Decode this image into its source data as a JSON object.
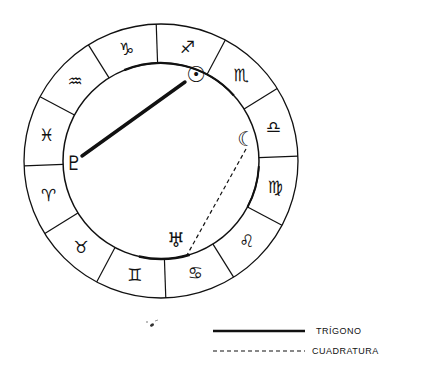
{
  "chart_data": {
    "type": "astrological-wheel",
    "title": "",
    "wheel": {
      "center": [
        161,
        161
      ],
      "outer_radius": 137,
      "inner_radius": 98,
      "rotation_deg": 2,
      "stroke": "#111111"
    },
    "signs": [
      {
        "name": "Sagittarius",
        "glyph": "♐",
        "start_deg": 60
      },
      {
        "name": "Capricorn",
        "glyph": "♑",
        "start_deg": 90
      },
      {
        "name": "Aquarius",
        "glyph": "♒",
        "start_deg": 120
      },
      {
        "name": "Pisces",
        "glyph": "♓",
        "start_deg": 150
      },
      {
        "name": "Aries",
        "glyph": "♈",
        "start_deg": 180
      },
      {
        "name": "Taurus",
        "glyph": "♉",
        "start_deg": 210
      },
      {
        "name": "Gemini",
        "glyph": "♊",
        "start_deg": 240
      },
      {
        "name": "Cancer",
        "glyph": "♋",
        "start_deg": 270
      },
      {
        "name": "Leo",
        "glyph": "♌",
        "start_deg": 300
      },
      {
        "name": "Virgo",
        "glyph": "♍",
        "start_deg": 330
      },
      {
        "name": "Libra",
        "glyph": "♎",
        "start_deg": 0
      },
      {
        "name": "Scorpio",
        "glyph": "♏",
        "start_deg": 30
      }
    ],
    "planets": [
      {
        "name": "Sun",
        "glyph": "☉",
        "x": 196,
        "y": 75
      },
      {
        "name": "Moon",
        "glyph": "☾",
        "x": 246,
        "y": 139
      },
      {
        "name": "Pluto",
        "glyph": "♇",
        "x": 74,
        "y": 163
      },
      {
        "name": "Uranus",
        "glyph": "♅",
        "x": 176,
        "y": 240
      }
    ],
    "aspects": [
      {
        "from": "Pluto",
        "to": "Sun",
        "type": "trigono",
        "style": "solid",
        "x1": 82,
        "y1": 156,
        "x2": 185,
        "y2": 82
      },
      {
        "from": "Moon",
        "to": "Uranus",
        "type": "cuadratura",
        "style": "dashed",
        "x1": 246,
        "y1": 149,
        "x2": 187,
        "y2": 255
      }
    ],
    "legend": [
      {
        "label": "TRÍGONO",
        "style": "solid"
      },
      {
        "label": "CUADRATURA",
        "style": "dashed"
      }
    ]
  }
}
